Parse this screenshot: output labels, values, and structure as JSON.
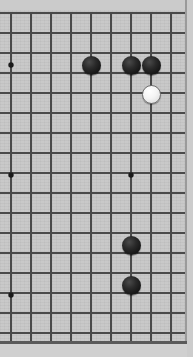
{
  "app": {
    "title": "Go Board",
    "board_type": "go-goban"
  },
  "board": {
    "background_color": "#c6c6c6",
    "line_color": "#4a4a4a",
    "border_color": "#5a5a5a",
    "black_stone_color": "#161616",
    "white_stone_color": "#f2f2f2",
    "cell_size": 20,
    "stone_radius": 9.5,
    "origin_x": 11,
    "origin_y": 13,
    "visible_columns": 9,
    "visible_rows": 17,
    "view_note": "partial view of a Go board, cropped on the top, right and bottom edges",
    "vertical_lines_x": [
      11,
      31,
      51,
      71,
      91,
      111,
      131,
      151,
      171
    ],
    "horizontal_lines_y": [
      13,
      33,
      53,
      73,
      93,
      113,
      133,
      153,
      173,
      193,
      213,
      233,
      253,
      273,
      293,
      313,
      333
    ],
    "board_top_edge_y": 13,
    "board_bottom_edge_y": 342,
    "board_right_edge_x": 186
  },
  "star_points": [
    {
      "name": "star-point-left-upper",
      "x": 11,
      "y": 65
    },
    {
      "name": "star-point-left-middle",
      "x": 11,
      "y": 175
    },
    {
      "name": "star-point-left-lower",
      "x": 11,
      "y": 295
    },
    {
      "name": "star-point-center-middle",
      "x": 131,
      "y": 175
    }
  ],
  "stones": [
    {
      "id": "black-1",
      "color": "black",
      "x": 91,
      "y": 65
    },
    {
      "id": "black-2",
      "color": "black",
      "x": 131,
      "y": 65
    },
    {
      "id": "black-3",
      "color": "black",
      "x": 151,
      "y": 65
    },
    {
      "id": "white-1",
      "color": "white",
      "x": 151,
      "y": 94
    },
    {
      "id": "black-4",
      "color": "black",
      "x": 131,
      "y": 245
    },
    {
      "id": "black-5",
      "color": "black",
      "x": 131,
      "y": 285
    }
  ],
  "counts": {
    "black_stones": 5,
    "white_stones": 1,
    "total_stones": 6
  }
}
